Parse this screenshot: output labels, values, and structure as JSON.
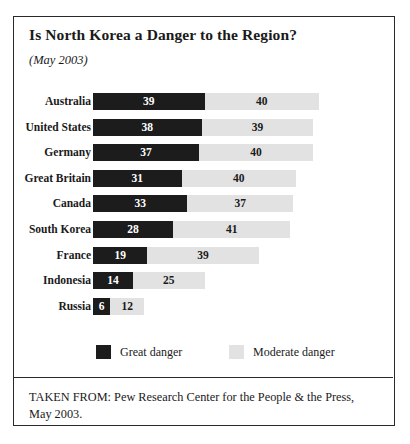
{
  "figure": {
    "title": "Is North Korea a Danger to the Region?",
    "subtitle": "(May 2003)",
    "source": "TAKEN FROM: Pew Research Center for the People & the Press, May 2003."
  },
  "legend": {
    "great": "Great danger",
    "moderate": "Moderate danger"
  },
  "colors": {
    "great": "#1c1c1c",
    "moderate": "#e2e2e2",
    "border": "#2a2a2a",
    "background": "#ffffff"
  },
  "chart_data": {
    "type": "bar",
    "orientation": "horizontal",
    "stacked": true,
    "title": "Is North Korea a Danger to the Region?",
    "subtitle": "(May 2003)",
    "xlabel": "",
    "ylabel": "",
    "grid": false,
    "legend_position": "bottom",
    "xlim": [
      0,
      100
    ],
    "units": "percent",
    "categories": [
      "Australia",
      "United States",
      "Germany",
      "Great Britain",
      "Canada",
      "South Korea",
      "France",
      "Indonesia",
      "Russia"
    ],
    "series": [
      {
        "name": "Great danger",
        "values": [
          39,
          38,
          37,
          31,
          33,
          28,
          19,
          14,
          6
        ]
      },
      {
        "name": "Moderate danger",
        "values": [
          40,
          39,
          40,
          40,
          37,
          41,
          39,
          25,
          12
        ]
      }
    ],
    "annotations": [
      "Source: Pew Research Center for the People & the Press, May 2003."
    ]
  }
}
